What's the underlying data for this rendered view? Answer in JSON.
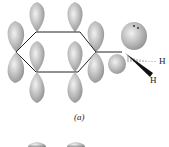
{
  "figure": {
    "caption": "(a)",
    "atoms": {
      "h_upper": "H",
      "h_lower": "H"
    },
    "colors": {
      "lobe": "#a9a9a9",
      "lobe_highlight": "#efefef",
      "bond": "#222222"
    }
  }
}
